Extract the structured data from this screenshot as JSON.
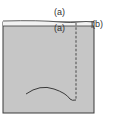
{
  "diagram": {
    "labels": {
      "top_a": "(a)",
      "inner_a": "(a)",
      "right_b": "(b)"
    },
    "colors": {
      "panel_fill": "#c6c6c6",
      "outline": "#3a3a3a",
      "strip_fill": "#f2f2f2",
      "background": "#ffffff"
    }
  }
}
